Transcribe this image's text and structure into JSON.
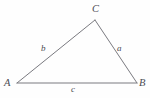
{
  "figure": {
    "type": "geometry-diagram",
    "shape": "triangle",
    "background_color": "#fefefe",
    "stroke_color": "#7a7a80",
    "label_color": "#4b4b52",
    "vertices": [
      {
        "id": "A",
        "label": "A",
        "x": 17,
        "y": 83
      },
      {
        "id": "B",
        "label": "B",
        "x": 137,
        "y": 83
      },
      {
        "id": "C",
        "label": "C",
        "x": 95,
        "y": 20
      }
    ],
    "sides": [
      {
        "id": "a",
        "label": "a",
        "from": "B",
        "to": "C",
        "label_x": 120,
        "label_y": 48
      },
      {
        "id": "b",
        "label": "b",
        "from": "A",
        "to": "C",
        "label_x": 44,
        "label_y": 48
      },
      {
        "id": "c",
        "label": "c",
        "from": "A",
        "to": "B",
        "label_x": 74,
        "label_y": 89
      }
    ]
  }
}
